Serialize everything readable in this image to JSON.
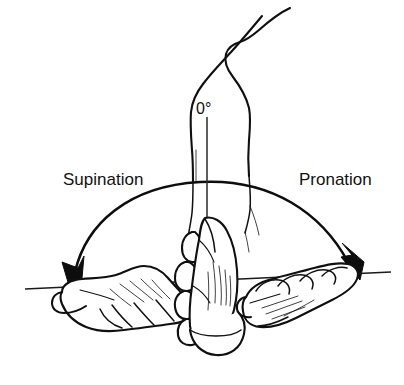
{
  "figure": {
    "background_color": "#ffffff",
    "ink_color": "#101010",
    "width": 404,
    "height": 385
  },
  "labels": {
    "supination": "Supination",
    "pronation": "Pronation",
    "neutral_angle": "0°"
  },
  "annotations": {
    "neutral_reference": "0°",
    "left_direction": "supination",
    "right_direction": "pronation"
  },
  "anatomy": {
    "arm_label": "upper-limb-outline",
    "center_hand_label": "neutral-hand",
    "left_hand_label": "supinated-hand-palm-up",
    "right_hand_label": "pronated-hand-palm-down"
  },
  "geometry": {
    "baseline_left_x": 25,
    "baseline_left_y": 289,
    "baseline_right_x": 391,
    "baseline_right_y": 272,
    "arc_apex_y": 182,
    "vertical_reference_x": 207,
    "left_arrow_tip_x": 70,
    "left_arrow_tip_y": 287,
    "right_arrow_tip_x": 357,
    "right_arrow_tip_y": 276
  }
}
